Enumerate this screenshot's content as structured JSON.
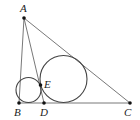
{
  "diagram": {
    "type": "geometry",
    "colors": {
      "line": "#555555",
      "circle": "#444444",
      "point": "#111111",
      "label": "#222222",
      "background": "#ffffff"
    },
    "points": {
      "A": {
        "label": "A",
        "x": 24,
        "y": 18
      },
      "B": {
        "label": "B",
        "x": 19,
        "y": 103
      },
      "C": {
        "label": "C",
        "x": 130,
        "y": 103
      },
      "D": {
        "label": "D",
        "x": 44,
        "y": 103
      },
      "E": {
        "label": "E",
        "x": 40.5,
        "y": 85
      }
    },
    "segments": [
      [
        "A",
        "B"
      ],
      [
        "A",
        "C"
      ],
      [
        "B",
        "C"
      ],
      [
        "A",
        "D"
      ]
    ],
    "circles": [
      {
        "name": "incircle-ABD",
        "cx": 28.5,
        "cy": 90,
        "r": 12.5
      },
      {
        "name": "incircle-ADC",
        "cx": 63.5,
        "cy": 79,
        "r": 23.5
      }
    ]
  }
}
